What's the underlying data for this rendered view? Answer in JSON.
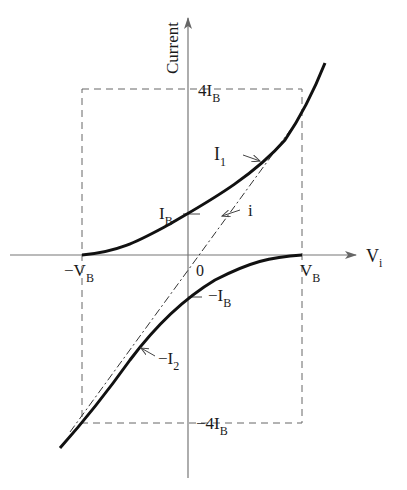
{
  "diagram": {
    "y_axis_label": "Current",
    "x_axis_label": {
      "main": "V",
      "sub": "i"
    },
    "origin_label": "0",
    "tick_labels": {
      "top": {
        "main": "4I",
        "sub": "B"
      },
      "bottom": {
        "main": "−4I",
        "sub": "B"
      },
      "left": {
        "main": "−V",
        "sub": "B"
      },
      "right": {
        "main": "V",
        "sub": "B"
      },
      "ib": {
        "main": "I",
        "sub": "B"
      },
      "neg_ib": {
        "main": "−I",
        "sub": "B"
      }
    },
    "curve_labels": {
      "i1": {
        "main": "I",
        "sub": "1"
      },
      "i": {
        "main": "i"
      },
      "neg_i2": {
        "main": "−I",
        "sub": "2"
      }
    },
    "colors": {
      "curve": "#111111",
      "axis": "#777777",
      "dashed": "#666666"
    }
  }
}
